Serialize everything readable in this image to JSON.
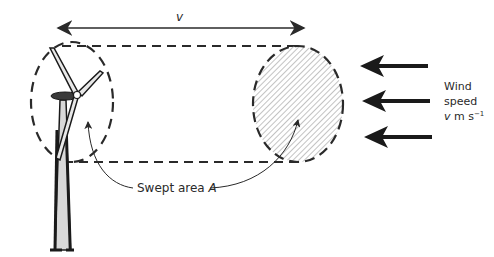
{
  "diagram": {
    "type": "wind turbine swept area illustration",
    "length_label": "v",
    "swept_area_label_text": "Swept area ",
    "swept_area_label_symbol": "A",
    "wind_label": {
      "line1": "Wind",
      "line2": "speed",
      "line3_symbol": "v",
      "line3_unit": " m s",
      "line3_exponent": "−1"
    },
    "wind_arrows_count": 3,
    "colors": {
      "ink": "#2a2a2a",
      "hatch": "#9a9a9a",
      "tower_fill": "#d8d8d8"
    }
  }
}
